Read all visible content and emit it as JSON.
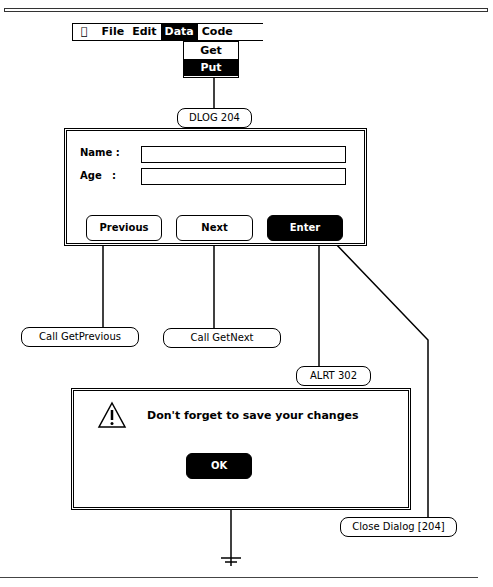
{
  "menubar": {
    "apple_icon": "apple-icon",
    "items": [
      {
        "label": "File",
        "selected": false
      },
      {
        "label": "Edit",
        "selected": false
      },
      {
        "label": "Data",
        "selected": true
      },
      {
        "label": "Code",
        "selected": false
      }
    ]
  },
  "dropdown": {
    "items": [
      {
        "label": "Get",
        "selected": false
      },
      {
        "label": "Put",
        "selected": true
      }
    ]
  },
  "dialog": {
    "id_tag": "DLOG 204",
    "fields": [
      {
        "label": "Name :",
        "value": ""
      },
      {
        "label": "Age   :",
        "value": ""
      }
    ],
    "buttons": {
      "previous": "Previous",
      "next": "Next",
      "enter": "Enter"
    }
  },
  "actions": {
    "previous": "Call GetPrevious",
    "next": "Call GetNext",
    "enter_alert": "ALRT 302",
    "enter_close": "Close Dialog [204]"
  },
  "alert": {
    "icon": "warning-icon",
    "message": "Don't forget to save your changes",
    "ok": "OK"
  },
  "terminal": {
    "icon": "ground-icon"
  }
}
